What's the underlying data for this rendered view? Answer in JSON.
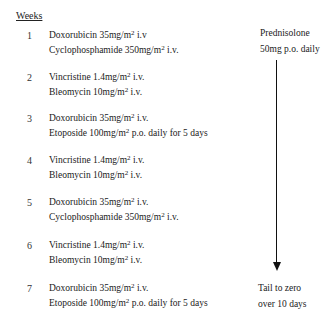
{
  "header": {
    "weeks_label": "Weeks"
  },
  "schedule": [
    {
      "week": "1",
      "lines": [
        {
          "drug": "Doxorubicin 35mg/m",
          "sup": "2",
          "route": " i.v"
        },
        {
          "drug": "Cyclophosphamide 350mg/m",
          "sup": "2",
          "route": " i.v."
        }
      ]
    },
    {
      "week": "2",
      "lines": [
        {
          "drug": "Vincristine 1.4mg/m",
          "sup": "2",
          "route": " i.v."
        },
        {
          "drug": "Bleomycin 10mg/m",
          "sup": "2",
          "route": " i.v."
        }
      ]
    },
    {
      "week": "3",
      "lines": [
        {
          "drug": "Doxorubicin 35mg/m",
          "sup": "2",
          "route": " i.v."
        },
        {
          "drug": "Etoposide 100mg/m",
          "sup": "2",
          "route": " p.o. daily for 5 days"
        }
      ]
    },
    {
      "week": "4",
      "lines": [
        {
          "drug": "Vincristine 1.4mg/m",
          "sup": "2",
          "route": " i.v."
        },
        {
          "drug": "Bleomycin 10mg/m",
          "sup": "2",
          "route": " i.v."
        }
      ]
    },
    {
      "week": "5",
      "lines": [
        {
          "drug": "Doxorubicin 35mg/m",
          "sup": "2",
          "route": " i.v."
        },
        {
          "drug": "Cyclophosphamide 350mg/m",
          "sup": "2",
          "route": " i.v."
        }
      ]
    },
    {
      "week": "6",
      "lines": [
        {
          "drug": "Vincristine 1.4mg/m",
          "sup": "2",
          "route": " i.v."
        },
        {
          "drug": "Bleomycin 10mg/m",
          "sup": "2",
          "route": " i.v."
        }
      ]
    },
    {
      "week": "7",
      "lines": [
        {
          "drug": "Doxorubicin 35mg/m",
          "sup": "2",
          "route": " i.v."
        },
        {
          "drug": "Etoposide 100mg/m",
          "sup": "2",
          "route": " p.o. daily for 5 days"
        }
      ]
    }
  ],
  "prednisolone": {
    "start_line1": "Prednisolone",
    "start_line2": "50mg p.o. daily",
    "end_line1": "Tail to zero",
    "end_line2": "over 10 days"
  }
}
